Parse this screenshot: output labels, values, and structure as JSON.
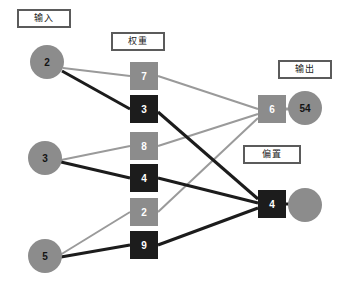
{
  "diagram": {
    "colors": {
      "gray": "#8c8c8c",
      "dark": "#1c1c1c",
      "edge_gray": "#9a9a9a",
      "edge_dark": "#1c1c1c",
      "box_border": "#5b5b5b",
      "background": "#ffffff"
    }
  },
  "labels": {
    "input": "输入",
    "weight": "权重",
    "output": "输出",
    "bias": "偏置"
  },
  "input_nodes": [
    {
      "id": "input-1",
      "value": "2",
      "cx": 47,
      "cy": 62,
      "r": 17,
      "fill": "gray",
      "text": "dark"
    },
    {
      "id": "input-2",
      "value": "3",
      "cx": 45,
      "cy": 158,
      "r": 17,
      "fill": "gray",
      "text": "dark"
    },
    {
      "id": "input-3",
      "value": "5",
      "cx": 45,
      "cy": 256,
      "r": 17,
      "fill": "gray",
      "text": "dark"
    }
  ],
  "weight_nodes": [
    {
      "id": "weight-7",
      "value": "7",
      "x": 130,
      "y": 62,
      "w": 28,
      "h": 28,
      "fill": "gray"
    },
    {
      "id": "weight-3",
      "value": "3",
      "x": 130,
      "y": 95,
      "w": 28,
      "h": 28,
      "fill": "dark"
    },
    {
      "id": "weight-8",
      "value": "8",
      "x": 130,
      "y": 132,
      "w": 28,
      "h": 28,
      "fill": "gray"
    },
    {
      "id": "weight-4",
      "value": "4",
      "x": 130,
      "y": 164,
      "w": 28,
      "h": 28,
      "fill": "dark"
    },
    {
      "id": "weight-2",
      "value": "2",
      "x": 130,
      "y": 198,
      "w": 28,
      "h": 28,
      "fill": "gray"
    },
    {
      "id": "weight-9",
      "value": "9",
      "x": 130,
      "y": 231,
      "w": 28,
      "h": 28,
      "fill": "dark"
    }
  ],
  "bias_nodes": [
    {
      "id": "bias-6",
      "value": "6",
      "x": 258,
      "y": 95,
      "w": 28,
      "h": 28,
      "fill": "gray"
    },
    {
      "id": "bias-4",
      "value": "4",
      "x": 258,
      "y": 190,
      "w": 28,
      "h": 28,
      "fill": "dark"
    }
  ],
  "output_nodes": [
    {
      "id": "output-1",
      "value": "54",
      "cx": 305,
      "cy": 108,
      "r": 17,
      "fill": "gray",
      "text": "dark"
    },
    {
      "id": "output-2",
      "value": "",
      "cx": 305,
      "cy": 205,
      "r": 17,
      "fill": "gray",
      "text": "dark"
    }
  ],
  "label_boxes": [
    {
      "id": "label-input",
      "key": "input",
      "x": 17,
      "y": 9,
      "w": 54,
      "h": 19
    },
    {
      "id": "label-weight",
      "key": "weight",
      "x": 111,
      "y": 32,
      "w": 54,
      "h": 19
    },
    {
      "id": "label-output",
      "key": "output",
      "x": 278,
      "y": 60,
      "w": 54,
      "h": 19
    },
    {
      "id": "label-bias",
      "key": "bias",
      "x": 243,
      "y": 145,
      "w": 58,
      "h": 19
    }
  ],
  "edges": [
    {
      "id": "edge-in2-w7",
      "from": "input-1",
      "to": "weight-7",
      "x1": 63,
      "y1": 68,
      "x2": 130,
      "y2": 76,
      "color": "gray",
      "width": 2
    },
    {
      "id": "edge-in2-w3",
      "from": "input-1",
      "to": "weight-3",
      "x1": 62,
      "y1": 71,
      "x2": 130,
      "y2": 109,
      "color": "dark",
      "width": 3
    },
    {
      "id": "edge-in3-w8",
      "from": "input-2",
      "to": "weight-8",
      "x1": 61,
      "y1": 160,
      "x2": 130,
      "y2": 146,
      "color": "gray",
      "width": 2
    },
    {
      "id": "edge-in3-w4",
      "from": "input-2",
      "to": "weight-4",
      "x1": 61,
      "y1": 162,
      "x2": 130,
      "y2": 178,
      "color": "dark",
      "width": 3
    },
    {
      "id": "edge-in5-w2",
      "from": "input-3",
      "to": "weight-2",
      "x1": 60,
      "y1": 255,
      "x2": 130,
      "y2": 212,
      "color": "gray",
      "width": 2
    },
    {
      "id": "edge-in5-w9",
      "from": "input-3",
      "to": "weight-9",
      "x1": 61,
      "y1": 257,
      "x2": 130,
      "y2": 245,
      "color": "dark",
      "width": 3
    },
    {
      "id": "edge-w7-b6",
      "from": "weight-7",
      "to": "bias-6",
      "x1": 158,
      "y1": 76,
      "x2": 258,
      "y2": 109,
      "color": "gray",
      "width": 2
    },
    {
      "id": "edge-w8-b6",
      "from": "weight-8",
      "to": "bias-6",
      "x1": 158,
      "y1": 146,
      "x2": 258,
      "y2": 114,
      "color": "gray",
      "width": 2
    },
    {
      "id": "edge-w2-b6",
      "from": "weight-2",
      "to": "bias-6",
      "x1": 158,
      "y1": 212,
      "x2": 258,
      "y2": 118,
      "color": "gray",
      "width": 2
    },
    {
      "id": "edge-w3-b4",
      "from": "weight-3",
      "to": "bias-4",
      "x1": 158,
      "y1": 112,
      "x2": 258,
      "y2": 199,
      "color": "dark",
      "width": 3
    },
    {
      "id": "edge-w4-b4",
      "from": "weight-4",
      "to": "bias-4",
      "x1": 158,
      "y1": 178,
      "x2": 258,
      "y2": 203,
      "color": "dark",
      "width": 3
    },
    {
      "id": "edge-w9-b4",
      "from": "weight-9",
      "to": "bias-4",
      "x1": 158,
      "y1": 245,
      "x2": 258,
      "y2": 208,
      "color": "dark",
      "width": 3
    },
    {
      "id": "edge-b6-out54",
      "from": "bias-6",
      "to": "output-1",
      "x1": 286,
      "y1": 109,
      "x2": 296,
      "y2": 109,
      "color": "gray",
      "width": 3
    },
    {
      "id": "edge-b4-out2",
      "from": "bias-4",
      "to": "output-2",
      "x1": 286,
      "y1": 204,
      "x2": 296,
      "y2": 204,
      "color": "dark",
      "width": 3
    }
  ]
}
